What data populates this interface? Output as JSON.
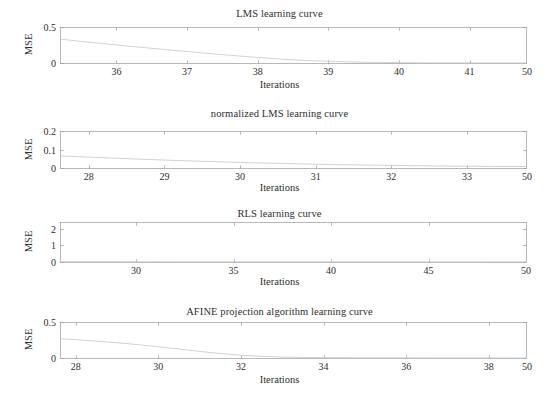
{
  "figure": {
    "background": "#ffffff",
    "axis_color": "#9a9a9a",
    "curve_color": "#c9c9c9",
    "text_color": "#2e2e2e",
    "shared_ylabel": "MSE",
    "shared_xlabel": "Iterations"
  },
  "chart_data": [
    {
      "type": "line",
      "title": "LMS learning curve",
      "xlabel": "Iterations",
      "ylabel": "MSE",
      "xlim": [
        35.2,
        41.8
      ],
      "ylim": [
        0,
        0.5
      ],
      "grid": false,
      "legend": null,
      "xticks": [
        36,
        37,
        38,
        39,
        40,
        41
      ],
      "xticklabels": [
        "36",
        "37",
        "38",
        "39",
        "40",
        "41"
      ],
      "x_edge_label": "50",
      "yticks": [
        0,
        0.5
      ],
      "yticklabels": [
        "0",
        "0.5"
      ],
      "x": [
        35.2,
        35.5,
        35.8,
        36.1,
        36.4,
        36.7,
        37.0,
        37.3,
        37.6,
        37.9,
        38.2,
        38.5,
        38.8,
        39.1,
        39.4,
        39.7,
        40.0,
        40.5,
        41.0,
        41.8
      ],
      "y": [
        0.332,
        0.3,
        0.27,
        0.241,
        0.213,
        0.186,
        0.16,
        0.133,
        0.108,
        0.084,
        0.062,
        0.044,
        0.03,
        0.02,
        0.013,
        0.008,
        0.005,
        0.002,
        0.001,
        0.0
      ]
    },
    {
      "type": "line",
      "title": "normalized LMS learning curve",
      "xlabel": "Iterations",
      "ylabel": "MSE",
      "xlim": [
        27.62,
        33.78
      ],
      "ylim": [
        0,
        0.2
      ],
      "grid": false,
      "legend": null,
      "xticks": [
        28,
        29,
        30,
        31,
        32,
        33
      ],
      "xticklabels": [
        "28",
        "29",
        "30",
        "31",
        "32",
        "33"
      ],
      "x_edge_label": "50",
      "yticks": [
        0,
        0.1,
        0.2
      ],
      "yticklabels": [
        "0",
        "0.1",
        "0.2"
      ],
      "x": [
        27.62,
        28.0,
        28.4,
        28.8,
        29.2,
        29.6,
        30.0,
        30.4,
        30.8,
        31.2,
        31.6,
        32.0,
        32.4,
        32.8,
        33.2,
        33.78
      ],
      "y": [
        0.065,
        0.059,
        0.052,
        0.046,
        0.04,
        0.035,
        0.03,
        0.026,
        0.022,
        0.019,
        0.016,
        0.014,
        0.012,
        0.01,
        0.009,
        0.008
      ]
    },
    {
      "type": "line",
      "title": "RLS learning curve",
      "xlabel": "Iterations",
      "ylabel": "MSE",
      "xlim": [
        26.1,
        50.0
      ],
      "ylim": [
        0,
        2.4
      ],
      "grid": false,
      "legend": null,
      "xticks": [
        30,
        35,
        40,
        45,
        50
      ],
      "xticklabels": [
        "30",
        "35",
        "40",
        "45",
        "50"
      ],
      "x_edge_label": null,
      "yticks": [
        0,
        1,
        2
      ],
      "yticklabels": [
        "0",
        "1",
        "2"
      ],
      "x": [
        26.1,
        28,
        30,
        32,
        34,
        36,
        38,
        40,
        42,
        44,
        45,
        46,
        48,
        50
      ],
      "y": [
        0.02,
        0.018,
        0.016,
        0.015,
        0.014,
        0.013,
        0.012,
        0.011,
        0.01,
        0.01,
        0.009,
        0.009,
        0.008,
        0.008
      ]
    },
    {
      "type": "line",
      "title": "AFINE projection algorithm learning curve",
      "xlabel": "Iterations",
      "ylabel": "MSE",
      "xlim": [
        27.62,
        38.9
      ],
      "ylim": [
        0,
        0.5
      ],
      "grid": false,
      "legend": null,
      "xticks": [
        28,
        30,
        32,
        34,
        36,
        38
      ],
      "xticklabels": [
        "28",
        "30",
        "32",
        "34",
        "36",
        "38"
      ],
      "x_edge_label": "50",
      "yticks": [
        0,
        0.5
      ],
      "yticklabels": [
        "0",
        "0.5"
      ],
      "x": [
        27.62,
        28.0,
        28.5,
        29.0,
        29.5,
        30.0,
        30.5,
        31.0,
        31.5,
        32.0,
        32.5,
        33.0,
        33.5,
        34.0,
        35.0,
        36.0,
        37.0,
        38.0,
        38.9
      ],
      "y": [
        0.268,
        0.255,
        0.235,
        0.212,
        0.186,
        0.156,
        0.124,
        0.092,
        0.062,
        0.038,
        0.022,
        0.013,
        0.008,
        0.005,
        0.003,
        0.002,
        0.001,
        0.001,
        0.0
      ]
    }
  ]
}
